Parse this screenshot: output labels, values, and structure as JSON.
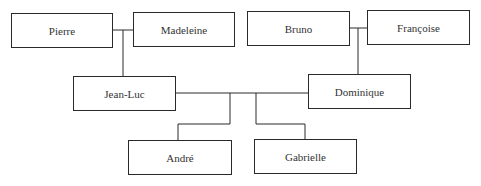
{
  "diagram": {
    "type": "family-tree",
    "people": [
      {
        "id": "pierre",
        "name": "Pierre",
        "x": 11,
        "y": 13,
        "w": 102,
        "h": 35
      },
      {
        "id": "madeleine",
        "name": "Madeleine",
        "x": 133,
        "y": 12,
        "w": 102,
        "h": 35
      },
      {
        "id": "bruno",
        "name": "Bruno",
        "x": 247,
        "y": 11,
        "w": 103,
        "h": 35
      },
      {
        "id": "francoise",
        "name": "Françoise",
        "x": 367,
        "y": 10,
        "w": 103,
        "h": 35
      },
      {
        "id": "jean-luc",
        "name": "Jean-Luc",
        "x": 73,
        "y": 76,
        "w": 103,
        "h": 35
      },
      {
        "id": "dominique",
        "name": "Dominique",
        "x": 308,
        "y": 74,
        "w": 103,
        "h": 35
      },
      {
        "id": "andre",
        "name": "André",
        "x": 128,
        "y": 140,
        "w": 104,
        "h": 35
      },
      {
        "id": "gabrielle",
        "name": "Gabrielle",
        "x": 254,
        "y": 139,
        "w": 103,
        "h": 35
      }
    ],
    "relationships": [
      {
        "type": "couple",
        "a": "Pierre",
        "b": "Madeleine",
        "children": [
          "Jean-Luc"
        ]
      },
      {
        "type": "couple",
        "a": "Bruno",
        "b": "Françoise",
        "children": [
          "Dominique"
        ]
      },
      {
        "type": "couple",
        "a": "Jean-Luc",
        "b": "Dominique",
        "children": [
          "André",
          "Gabrielle"
        ]
      }
    ]
  }
}
